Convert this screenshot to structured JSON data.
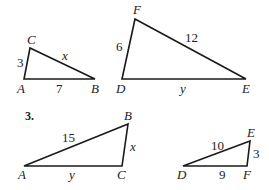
{
  "problem_number": "3.",
  "figures": [
    {
      "id": "triangle-abc-top",
      "vertices": {
        "A": "A",
        "B": "B",
        "C": "C"
      },
      "sides": {
        "AC": "3",
        "CB": "x",
        "AB": "7"
      }
    },
    {
      "id": "triangle-def-top",
      "vertices": {
        "D": "D",
        "E": "E",
        "F": "F"
      },
      "sides": {
        "DF": "6",
        "FE": "12",
        "DE": "y"
      }
    },
    {
      "id": "triangle-abc-bottom",
      "vertices": {
        "A": "A",
        "B": "B",
        "C": "C"
      },
      "sides": {
        "AB": "15",
        "BC": "x",
        "AC": "y"
      }
    },
    {
      "id": "triangle-def-bottom",
      "vertices": {
        "D": "D",
        "E": "E",
        "F": "F"
      },
      "sides": {
        "DE": "10",
        "EF": "3",
        "DF": "9"
      }
    }
  ]
}
